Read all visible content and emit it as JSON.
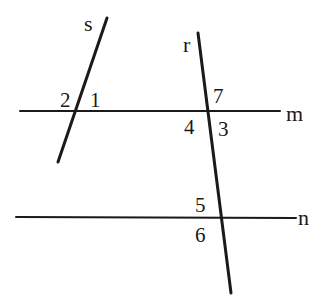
{
  "diagram": {
    "type": "geometry-transversals",
    "lines": [
      {
        "name": "s",
        "label": "s",
        "x1": 107,
        "y1": 18,
        "x2": 58,
        "y2": 162,
        "label_x": 84,
        "label_y": 31
      },
      {
        "name": "r",
        "label": "r",
        "x1": 198,
        "y1": 33,
        "x2": 231,
        "y2": 293,
        "label_x": 183,
        "label_y": 52
      },
      {
        "name": "m",
        "label": "m",
        "x1": 20,
        "y1": 111,
        "x2": 280,
        "y2": 111,
        "label_x": 286,
        "label_y": 121
      },
      {
        "name": "n",
        "label": "n",
        "x1": 16,
        "y1": 217,
        "x2": 296,
        "y2": 218,
        "label_x": 298,
        "label_y": 225
      }
    ],
    "angles": [
      {
        "label": "1",
        "x": 90,
        "y": 107
      },
      {
        "label": "2",
        "x": 60,
        "y": 107
      },
      {
        "label": "7",
        "x": 213,
        "y": 103
      },
      {
        "label": "4",
        "x": 184,
        "y": 134
      },
      {
        "label": "3",
        "x": 218,
        "y": 136
      },
      {
        "label": "5",
        "x": 195,
        "y": 212
      },
      {
        "label": "6",
        "x": 195,
        "y": 242
      }
    ],
    "stroke_color": "#1a1a1a",
    "background": "#ffffff"
  }
}
